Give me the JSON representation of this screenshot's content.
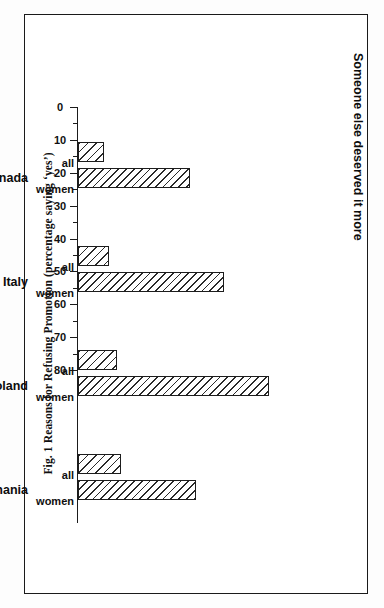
{
  "figure": {
    "caption": "Fig. 1 Reasons for Refusing Promotion (percentage saying ‘yes’)"
  },
  "chart_data": {
    "type": "bar",
    "orientation": "vertical-rotated-90",
    "title": "Someone else deserved it more",
    "subtitle": "Someone else deserved it more",
    "xlabel": "",
    "ylabel": "",
    "ylim": [
      0,
      80
    ],
    "ytick_step": 10,
    "minor_tick_step": 5,
    "grid": false,
    "legend": "inline-axis-labels",
    "categories": [
      "Canada",
      "Italy",
      "Poland",
      "Romania"
    ],
    "series_labels": [
      "all",
      "women"
    ],
    "tick_labels": [
      "0",
      "10",
      "20",
      "30",
      "40",
      "50",
      "60",
      "70",
      "80"
    ],
    "tick_values": [
      0,
      10,
      20,
      30,
      40,
      50,
      60,
      70,
      80
    ],
    "series": [
      {
        "name": "all",
        "values": [
          8,
          9.5,
          12,
          13
        ]
      },
      {
        "name": "women",
        "values": [
          34,
          44.5,
          58,
          36
        ]
      }
    ],
    "groups": [
      {
        "category": "Canada",
        "all": 8,
        "women": 34
      },
      {
        "category": "Italy",
        "all": 9.5,
        "women": 44.5
      },
      {
        "category": "Poland",
        "all": 12,
        "women": 58
      },
      {
        "category": "Romania",
        "all": 13,
        "women": 36
      }
    ]
  },
  "colors": {
    "ink": "#1a1a1a",
    "paper": "#ffffff",
    "hatch": "#2a2a2a"
  }
}
